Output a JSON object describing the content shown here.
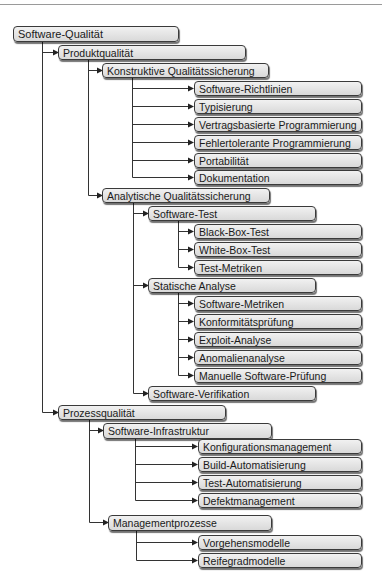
{
  "diagram": {
    "type": "tree",
    "root": {
      "label": "Software-Qualität",
      "children": [
        {
          "label": "Produktqualität",
          "children": [
            {
              "label": "Konstruktive Qualitätssicherung",
              "children": [
                {
                  "label": "Software-Richtlinien"
                },
                {
                  "label": "Typisierung"
                },
                {
                  "label": "Vertragsbasierte Programmierung"
                },
                {
                  "label": "Fehlertolerante Programmierung"
                },
                {
                  "label": "Portabilität"
                },
                {
                  "label": "Dokumentation"
                }
              ]
            },
            {
              "label": "Analytische Qualitätssicherung",
              "children": [
                {
                  "label": "Software-Test",
                  "children": [
                    {
                      "label": "Black-Box-Test"
                    },
                    {
                      "label": "White-Box-Test"
                    },
                    {
                      "label": "Test-Metriken"
                    }
                  ]
                },
                {
                  "label": "Statische Analyse",
                  "children": [
                    {
                      "label": "Software-Metriken"
                    },
                    {
                      "label": "Konformitätsprüfung"
                    },
                    {
                      "label": "Exploit-Analyse"
                    },
                    {
                      "label": "Anomalienanalyse"
                    },
                    {
                      "label": "Manuelle Software-Prüfung"
                    }
                  ]
                },
                {
                  "label": "Software-Verifikation"
                }
              ]
            }
          ]
        },
        {
          "label": "Prozessqualität",
          "children": [
            {
              "label": "Software-Infrastruktur",
              "children": [
                {
                  "label": "Konfigurationsmanagement"
                },
                {
                  "label": "Build-Automatisierung"
                },
                {
                  "label": "Test-Automatisierung"
                },
                {
                  "label": "Defektmanagement"
                }
              ]
            },
            {
              "label": "Managementprozesse",
              "children": [
                {
                  "label": "Vorgehensmodelle"
                },
                {
                  "label": "Reifegradmodelle"
                }
              ]
            }
          ]
        }
      ]
    }
  },
  "nodes": {
    "root": "Software-Qualität",
    "produkt": "Produktqualität",
    "konstruktiv": "Konstruktive Qualitätssicherung",
    "richtlinien": "Software-Richtlinien",
    "typisierung": "Typisierung",
    "vertrag": "Vertragsbasierte Programmierung",
    "fehlertolerant": "Fehlertolerante Programmierung",
    "portabilitaet": "Portabilität",
    "dokumentation": "Dokumentation",
    "analytisch": "Analytische Qualitätssicherung",
    "test": "Software-Test",
    "blackbox": "Black-Box-Test",
    "whitebox": "White-Box-Test",
    "testmetriken": "Test-Metriken",
    "statisch": "Statische Analyse",
    "swmetriken": "Software-Metriken",
    "konformitaet": "Konformitätsprüfung",
    "exploit": "Exploit-Analyse",
    "anomalie": "Anomalienanalyse",
    "manuell": "Manuelle Software-Prüfung",
    "verifikation": "Software-Verifikation",
    "prozess": "Prozessqualität",
    "infrastruktur": "Software-Infrastruktur",
    "konfig": "Konfigurationsmanagement",
    "build": "Build-Automatisierung",
    "testauto": "Test-Automatisierung",
    "defekt": "Defektmanagement",
    "management": "Managementprozesse",
    "vorgehen": "Vorgehensmodelle",
    "reifegrad": "Reifegradmodelle"
  }
}
